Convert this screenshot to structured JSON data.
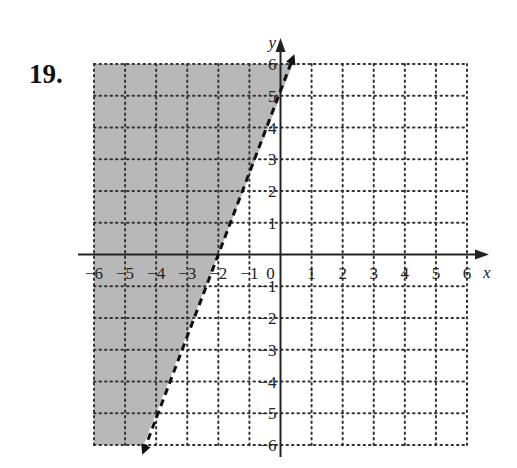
{
  "problem": {
    "number_label": "19."
  },
  "chart_data": {
    "type": "inequality-graph",
    "title": "",
    "xlabel": "x",
    "ylabel": "y",
    "xlim": [
      -6,
      6
    ],
    "ylim": [
      -6,
      6
    ],
    "grid": true,
    "grid_style": "dotted",
    "x_ticks": [
      -6,
      -5,
      -4,
      -3,
      -2,
      -1,
      0,
      1,
      2,
      3,
      4,
      5,
      6
    ],
    "y_ticks": [
      -6,
      -5,
      -4,
      -3,
      -2,
      -1,
      1,
      2,
      3,
      4,
      5,
      6
    ],
    "x_tick_labels": [
      "−6",
      "−5",
      "−4",
      "−3",
      "−2",
      "−1",
      "0",
      "1",
      "2",
      "3",
      "4",
      "5",
      "6"
    ],
    "y_tick_labels": [
      "−6",
      "−5",
      "−4",
      "−3",
      "−2",
      "−1",
      "1",
      "2",
      "3",
      "4",
      "5",
      "6"
    ],
    "boundary_line": {
      "equation": "y = 2.5x + 5",
      "slope": 2.5,
      "y_intercept": 5,
      "x_intercept": -2,
      "style": "dashed",
      "arrows": "both",
      "endpoints": [
        [
          -4.4,
          -6
        ],
        [
          0.4,
          6
        ]
      ]
    },
    "shaded_region": {
      "side": "left/above line",
      "inequality": "y > 2.5x + 5",
      "color": "#b8b8b8"
    }
  }
}
